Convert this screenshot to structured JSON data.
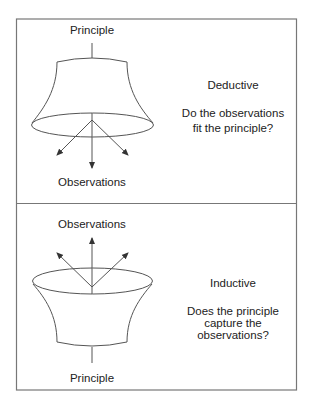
{
  "panels": [
    {
      "id": "deductive",
      "title": "Deductive",
      "top_label": "Principle",
      "bottom_label": "Observations",
      "question_lines": [
        "Do the observations",
        "fit the principle?"
      ],
      "arrow_direction": "down"
    },
    {
      "id": "inductive",
      "title": "Inductive",
      "top_label": "Observations",
      "bottom_label": "Principle",
      "question_lines": [
        "Does the principle",
        "capture the",
        "observations?"
      ],
      "arrow_direction": "up"
    }
  ],
  "colors": {
    "line": "#555555",
    "frame": "#777777",
    "text": "#222222",
    "background": "#ffffff"
  }
}
